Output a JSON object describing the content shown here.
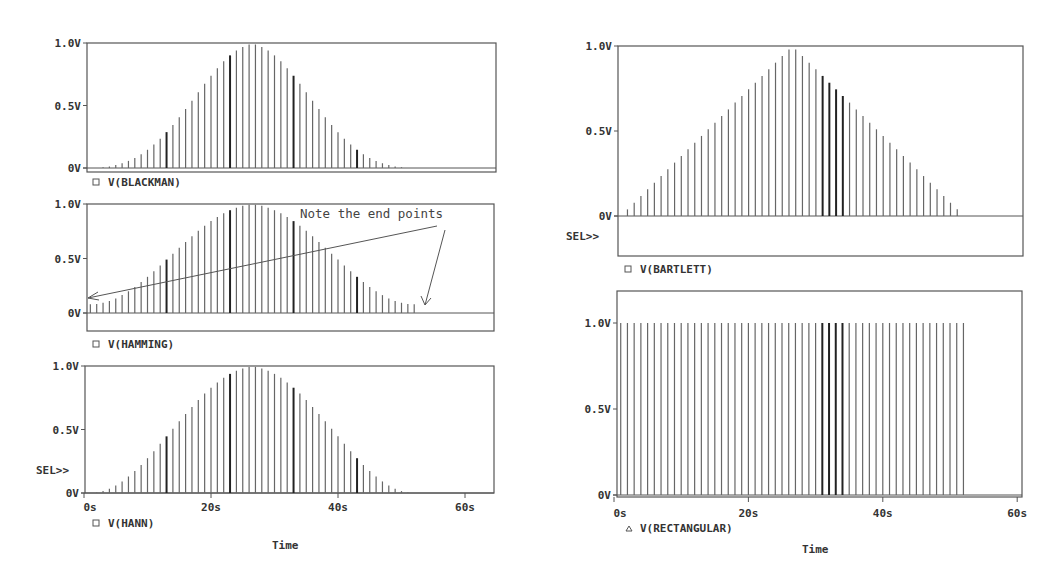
{
  "annotation": {
    "text": "Note the end points"
  },
  "sel_marker": "SEL>>",
  "x_axis": {
    "label": "Time",
    "ticks": [
      "0s",
      "20s",
      "40s",
      "60s"
    ],
    "tick_values": [
      0,
      20,
      40,
      60
    ]
  },
  "y_ticks": [
    "0V",
    "0.5V",
    "1.0V"
  ],
  "chart_data": [
    {
      "type": "bar",
      "title": "V(BLACKMAN)",
      "legend": "V(BLACKMAN)",
      "legend_marker": "square",
      "xlabel": "Time",
      "ylabel": "",
      "x_unit": "s",
      "xlim": [
        0,
        63
      ],
      "ylim": [
        0,
        1.0
      ],
      "ytick_labels": [
        "0V",
        "0.5V",
        "1.0V"
      ],
      "x": [
        1,
        2,
        3,
        4,
        5,
        6,
        7,
        8,
        9,
        10,
        11,
        12,
        13,
        14,
        15,
        16,
        17,
        18,
        19,
        20,
        21,
        22,
        23,
        24,
        25,
        26,
        27,
        28,
        29,
        30,
        31,
        32,
        33,
        34,
        35,
        36,
        37,
        38,
        39,
        40,
        41,
        42,
        43,
        44,
        45,
        46,
        47,
        48,
        49,
        50,
        51,
        52
      ],
      "values": [
        0,
        0.001,
        0.006,
        0.013,
        0.024,
        0.038,
        0.057,
        0.081,
        0.111,
        0.146,
        0.188,
        0.235,
        0.287,
        0.345,
        0.407,
        0.472,
        0.539,
        0.607,
        0.674,
        0.738,
        0.799,
        0.854,
        0.901,
        0.94,
        0.969,
        0.988,
        0.988,
        0.969,
        0.94,
        0.901,
        0.854,
        0.799,
        0.738,
        0.674,
        0.607,
        0.539,
        0.472,
        0.407,
        0.345,
        0.287,
        0.235,
        0.188,
        0.146,
        0.111,
        0.081,
        0.057,
        0.038,
        0.024,
        0.013,
        0.006,
        0.001,
        0
      ]
    },
    {
      "type": "bar",
      "title": "V(HAMMING)",
      "legend": "V(HAMMING)",
      "legend_marker": "square",
      "xlabel": "Time",
      "ylabel": "",
      "x_unit": "s",
      "xlim": [
        0,
        63
      ],
      "ylim": [
        -0.3,
        1.0
      ],
      "ytick_labels": [
        "0V",
        "0.5V",
        "1.0V"
      ],
      "annotation": "Note the end points",
      "x": [
        1,
        2,
        3,
        4,
        5,
        6,
        7,
        8,
        9,
        10,
        11,
        12,
        13,
        14,
        15,
        16,
        17,
        18,
        19,
        20,
        21,
        22,
        23,
        24,
        25,
        26,
        27,
        28,
        29,
        30,
        31,
        32,
        33,
        34,
        35,
        36,
        37,
        38,
        39,
        40,
        41,
        42,
        43,
        44,
        45,
        46,
        47,
        48,
        49,
        50,
        51,
        52
      ],
      "values": [
        0.08,
        0.083,
        0.094,
        0.111,
        0.134,
        0.164,
        0.199,
        0.239,
        0.284,
        0.332,
        0.383,
        0.436,
        0.49,
        0.544,
        0.599,
        0.652,
        0.704,
        0.754,
        0.8,
        0.843,
        0.881,
        0.915,
        0.943,
        0.966,
        0.983,
        0.993,
        0.993,
        0.983,
        0.966,
        0.943,
        0.915,
        0.881,
        0.843,
        0.8,
        0.754,
        0.704,
        0.652,
        0.599,
        0.544,
        0.49,
        0.436,
        0.383,
        0.332,
        0.284,
        0.239,
        0.199,
        0.164,
        0.134,
        0.111,
        0.094,
        0.083,
        0.08
      ]
    },
    {
      "type": "bar",
      "title": "V(HANN)",
      "legend": "V(HANN)",
      "legend_marker": "square",
      "xlabel": "Time",
      "ylabel": "",
      "x_unit": "s",
      "xlim": [
        0,
        63
      ],
      "ylim": [
        0,
        1.0
      ],
      "ytick_labels": [
        "0V",
        "0.5V",
        "1.0V"
      ],
      "xtick_labels": [
        "0s",
        "20s",
        "40s",
        "60s"
      ],
      "x": [
        1,
        2,
        3,
        4,
        5,
        6,
        7,
        8,
        9,
        10,
        11,
        12,
        13,
        14,
        15,
        16,
        17,
        18,
        19,
        20,
        21,
        22,
        23,
        24,
        25,
        26,
        27,
        28,
        29,
        30,
        31,
        32,
        33,
        34,
        35,
        36,
        37,
        38,
        39,
        40,
        41,
        42,
        43,
        44,
        45,
        46,
        47,
        48,
        49,
        50,
        51,
        52
      ],
      "values": [
        0,
        0.004,
        0.015,
        0.034,
        0.059,
        0.091,
        0.13,
        0.173,
        0.221,
        0.274,
        0.329,
        0.387,
        0.446,
        0.505,
        0.564,
        0.622,
        0.678,
        0.732,
        0.783,
        0.829,
        0.871,
        0.907,
        0.938,
        0.963,
        0.981,
        0.993,
        0.993,
        0.981,
        0.963,
        0.938,
        0.907,
        0.871,
        0.829,
        0.783,
        0.732,
        0.678,
        0.622,
        0.564,
        0.505,
        0.446,
        0.387,
        0.329,
        0.274,
        0.221,
        0.173,
        0.13,
        0.091,
        0.059,
        0.034,
        0.015,
        0.004,
        0
      ]
    },
    {
      "type": "bar",
      "title": "V(BARTLETT)",
      "legend": "V(BARTLETT)",
      "legend_marker": "square",
      "xlabel": "Time",
      "ylabel": "",
      "x_unit": "s",
      "xlim": [
        0,
        63
      ],
      "ylim": [
        -0.45,
        1.0
      ],
      "ytick_labels": [
        "0V",
        "0.5V",
        "1.0V"
      ],
      "x": [
        1,
        2,
        3,
        4,
        5,
        6,
        7,
        8,
        9,
        10,
        11,
        12,
        13,
        14,
        15,
        16,
        17,
        18,
        19,
        20,
        21,
        22,
        23,
        24,
        25,
        26,
        27,
        28,
        29,
        30,
        31,
        32,
        33,
        34,
        35,
        36,
        37,
        38,
        39,
        40,
        41,
        42,
        43,
        44,
        45,
        46,
        47,
        48,
        49,
        50,
        51,
        52
      ],
      "values": [
        0,
        0.039,
        0.078,
        0.118,
        0.157,
        0.196,
        0.235,
        0.275,
        0.314,
        0.353,
        0.392,
        0.431,
        0.471,
        0.51,
        0.549,
        0.588,
        0.627,
        0.667,
        0.706,
        0.745,
        0.784,
        0.824,
        0.863,
        0.902,
        0.941,
        0.98,
        0.98,
        0.941,
        0.902,
        0.863,
        0.824,
        0.784,
        0.745,
        0.706,
        0.667,
        0.627,
        0.588,
        0.549,
        0.51,
        0.471,
        0.431,
        0.392,
        0.353,
        0.314,
        0.275,
        0.235,
        0.196,
        0.157,
        0.118,
        0.078,
        0.039,
        0
      ]
    },
    {
      "type": "bar",
      "title": "V(RECTANGULAR)",
      "legend": "V(RECTANGULAR)",
      "legend_marker": "triangle",
      "xlabel": "Time",
      "ylabel": "",
      "x_unit": "s",
      "xlim": [
        0,
        60.5
      ],
      "ylim": [
        0,
        1.2
      ],
      "ytick_labels": [
        "0V",
        "0.5V",
        "1.0V"
      ],
      "xtick_labels": [
        "0s",
        "20s",
        "40s",
        "60s"
      ],
      "x": [
        1,
        2,
        3,
        4,
        5,
        6,
        7,
        8,
        9,
        10,
        11,
        12,
        13,
        14,
        15,
        16,
        17,
        18,
        19,
        20,
        21,
        22,
        23,
        24,
        25,
        26,
        27,
        28,
        29,
        30,
        31,
        32,
        33,
        34,
        35,
        36,
        37,
        38,
        39,
        40,
        41,
        42,
        43,
        44,
        45,
        46,
        47,
        48,
        49,
        50,
        51,
        52
      ],
      "values": [
        1,
        1,
        1,
        1,
        1,
        1,
        1,
        1,
        1,
        1,
        1,
        1,
        1,
        1,
        1,
        1,
        1,
        1,
        1,
        1,
        1,
        1,
        1,
        1,
        1,
        1,
        1,
        1,
        1,
        1,
        1,
        1,
        1,
        1,
        1,
        1,
        1,
        1,
        1,
        1,
        1,
        1,
        1,
        1,
        1,
        1,
        1,
        1,
        1,
        1,
        1,
        1
      ]
    }
  ]
}
